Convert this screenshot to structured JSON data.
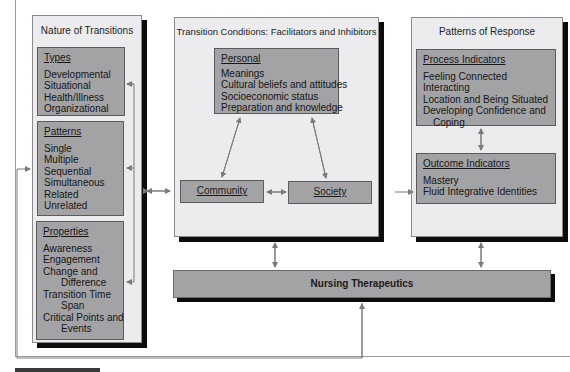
{
  "diagram": {
    "nature": {
      "title": "Nature of Transitions",
      "types": {
        "heading": "Types",
        "items": [
          "Developmental",
          "Situational",
          "Health/Illness",
          "Organizational"
        ]
      },
      "patterns": {
        "heading": "Patterns",
        "items": [
          "Single",
          "Multiple",
          "Sequential",
          "Simultaneous",
          "Related",
          "Unrelated"
        ]
      },
      "properties": {
        "heading": "Properties",
        "items": [
          "Awareness",
          "Engagement",
          "Change and",
          "Difference",
          "Transition Time",
          "Span",
          "Critical Points and",
          "Events"
        ]
      }
    },
    "conditions": {
      "title": "Transition Conditions: Facilitators and Inhibitors",
      "personal": {
        "heading": "Personal",
        "items": [
          "Meanings",
          "Cultural beliefs and attitudes",
          "Socioeconomic status",
          "Preparation and knowledge"
        ]
      },
      "community": "Community",
      "society": "Society"
    },
    "response": {
      "title": "Patterns of Response",
      "process": {
        "heading": "Process Indicators",
        "items": [
          "Feeling Connected",
          "Interacting",
          "Location and Being Situated",
          "Developing Confidence and",
          "Coping"
        ]
      },
      "outcome": {
        "heading": "Outcome Indicators",
        "items": [
          "Mastery",
          "Fluid Integrative Identities"
        ]
      }
    },
    "therapeutics": "Nursing Therapeutics",
    "colors": {
      "panel": "#ececee",
      "box": "#a3a3a5",
      "shadow": "#0d0d0d",
      "arrow": "#7a7a7a"
    }
  }
}
